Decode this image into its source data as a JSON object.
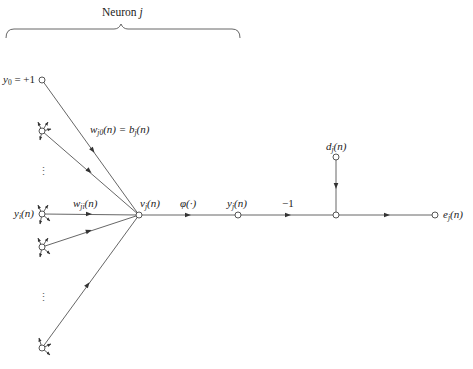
{
  "diagram": {
    "title": "Neuron j",
    "title_parts": {
      "word": "Neuron",
      "index": "j"
    },
    "colors": {
      "line": "#555555",
      "text": "#222222",
      "node_fill": "#ffffff"
    },
    "labels": {
      "y0": {
        "var": "y",
        "sub": "0",
        "rest": " = +1"
      },
      "bias_weight": {
        "w": "w",
        "w_sub": "j0",
        "w_arg": "(n) = ",
        "b": "b",
        "b_sub": "j",
        "b_arg": "(n)"
      },
      "yi": {
        "var": "y",
        "sub": "i",
        "arg": "(n)"
      },
      "wji": {
        "var": "w",
        "sub": "ji",
        "arg": "(n)"
      },
      "vj": {
        "var": "v",
        "sub": "j",
        "arg": "(n)"
      },
      "phi": {
        "text": "φ(·)"
      },
      "yj": {
        "var": "y",
        "sub": "j",
        "arg": "(n)"
      },
      "minus_one": {
        "text": "−1"
      },
      "dj": {
        "var": "d",
        "sub": "j",
        "arg": "(n)"
      },
      "ej": {
        "var": "e",
        "sub": "j",
        "arg": "(n)"
      },
      "ellipsis_upper": "⋮",
      "ellipsis_lower": "⋮"
    },
    "nodes": [
      {
        "id": "y0",
        "x": 42,
        "y": 80
      },
      {
        "id": "input-1",
        "x": 42,
        "y": 131
      },
      {
        "id": "yi",
        "x": 42,
        "y": 214
      },
      {
        "id": "input-3",
        "x": 42,
        "y": 247
      },
      {
        "id": "input-m",
        "x": 42,
        "y": 348
      },
      {
        "id": "vj",
        "x": 139,
        "y": 215
      },
      {
        "id": "yj",
        "x": 238,
        "y": 215
      },
      {
        "id": "sum",
        "x": 336,
        "y": 215
      },
      {
        "id": "dj",
        "x": 336,
        "y": 157
      },
      {
        "id": "ej",
        "x": 435,
        "y": 215
      }
    ],
    "edges": [
      {
        "from": "y0",
        "to": "vj",
        "label": "w_j0(n) = b_j(n)"
      },
      {
        "from": "input-1",
        "to": "vj"
      },
      {
        "from": "yi",
        "to": "vj",
        "label": "w_ji(n)"
      },
      {
        "from": "input-3",
        "to": "vj"
      },
      {
        "from": "input-m",
        "to": "vj"
      },
      {
        "from": "vj",
        "to": "yj",
        "label": "φ(·)"
      },
      {
        "from": "yj",
        "to": "sum",
        "label": "−1"
      },
      {
        "from": "dj",
        "to": "sum"
      },
      {
        "from": "sum",
        "to": "ej"
      }
    ],
    "caption": ""
  }
}
